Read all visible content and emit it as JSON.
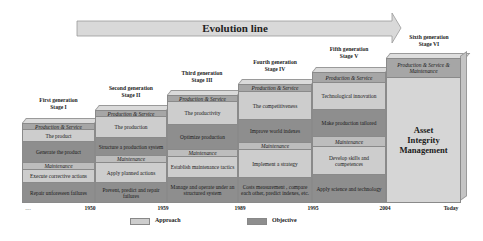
{
  "arrow": {
    "label": "Evolution line"
  },
  "stages": [
    {
      "generation": "First generation",
      "stage": "Stage I",
      "ps_label": "Production & Service",
      "ps_approach": "The product",
      "ps_objective": "Generate the product",
      "m_label": "Maintenance",
      "m_approach": "Execute corrective actions",
      "m_objective": "Repair unforeseen failures"
    },
    {
      "generation": "Second generation",
      "stage": "Stage II",
      "ps_label": "Production & Service",
      "ps_approach": "The production",
      "ps_objective": "Structure a production system",
      "m_label": "Maintenance",
      "m_approach": "Apply planned actions",
      "m_objective": "Prevent, predict and repair failures"
    },
    {
      "generation": "Third generation",
      "stage": "Stage III",
      "ps_label": "Production & Service",
      "ps_approach": "The productivity",
      "ps_objective": "Optimize production",
      "m_label": "Maintenance",
      "m_approach": "Establish maintenance tactics",
      "m_objective": "Manage and operate under an structured system"
    },
    {
      "generation": "Fourth generation",
      "stage": "Stage IV",
      "ps_label": "Production & Service",
      "ps_approach": "The competitiveness",
      "ps_objective": "Improve world indexes",
      "m_label": "Maintenance",
      "m_approach": "Implement a strategy",
      "m_objective": "Costs measurement , compare each other, predict indexes, etc."
    },
    {
      "generation": "Fifth generation",
      "stage": "Stage V",
      "ps_label": "Production & Service",
      "ps_approach": "Technological innovation",
      "ps_objective": "Make production tailored",
      "m_label": "Maintenance",
      "m_approach": "Develop skills and competences",
      "m_objective": "Apply science and technology"
    },
    {
      "generation": "Sixth generation",
      "stage": "Stage VI",
      "band": "Production & Service & Maintenance",
      "body": "Asset Integrity Management"
    }
  ],
  "timeline": [
    "....",
    "1950",
    "1959",
    "1989",
    "1995",
    "2004",
    "Today"
  ],
  "legend": [
    {
      "label": "Approach",
      "color": "#cdcdcd"
    },
    {
      "label": "Objective",
      "color": "#8e8e8e"
    }
  ],
  "colors": {
    "approach": "#cdcdcd",
    "objective": "#8e8e8e",
    "section_band": "#a6a6a6",
    "maintenance_band": "#bdbdbd",
    "arrow_fill": "#d9d9d9"
  }
}
